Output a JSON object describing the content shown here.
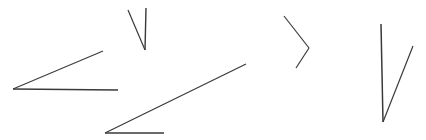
{
  "canvas": {
    "width": 426,
    "height": 140,
    "background_color": "#ffffff",
    "stroke_color": "#3a3a3a",
    "description": "Line drawing of five separate angle figures formed by pairs of straight line segments on a plain white background"
  },
  "chart_data": {
    "type": "diagram",
    "title": "",
    "xlabel": "",
    "ylabel": "",
    "xlim": [
      0,
      426
    ],
    "ylim": [
      140,
      0
    ],
    "grid": false,
    "legend": false,
    "shapes": [
      {
        "name": "acute-angle-left",
        "label": "Acute angle opening to the right",
        "vertex": [
          13,
          89
        ],
        "rays": [
          {
            "name": "upper-ray",
            "from": [
              13,
              89
            ],
            "to": [
              103,
              51
            ],
            "stroke_width": 1.1
          },
          {
            "name": "horizontal-ray",
            "from": [
              13,
              89
            ],
            "to": [
              118,
              90
            ],
            "stroke_width": 1.4
          }
        ]
      },
      {
        "name": "narrow-v-top",
        "label": "Narrow V opening upward",
        "vertex": [
          145,
          50
        ],
        "rays": [
          {
            "name": "left-ray",
            "from": [
              145,
              50
            ],
            "to": [
              128,
              10
            ],
            "stroke_width": 1.2
          },
          {
            "name": "right-ray",
            "from": [
              145,
              50
            ],
            "to": [
              146,
              8
            ],
            "stroke_width": 1.4
          }
        ]
      },
      {
        "name": "wide-angle-bottom",
        "label": "Wide angle opening to the upper right",
        "vertex": [
          105,
          133
        ],
        "rays": [
          {
            "name": "diagonal-ray",
            "from": [
              105,
              133
            ],
            "to": [
              246,
              64
            ],
            "stroke_width": 1.2
          },
          {
            "name": "horizontal-ray",
            "from": [
              105,
              133
            ],
            "to": [
              164,
              133
            ],
            "stroke_width": 1.4
          }
        ]
      },
      {
        "name": "chevron-right",
        "label": "Angle shaped like a greater-than sign opening to the left",
        "vertex": [
          309,
          48
        ],
        "rays": [
          {
            "name": "upper-ray",
            "from": [
              309,
              48
            ],
            "to": [
              284,
              16
            ],
            "stroke_width": 1.2
          },
          {
            "name": "lower-ray",
            "from": [
              309,
              48
            ],
            "to": [
              296,
              68
            ],
            "stroke_width": 1.2
          }
        ]
      },
      {
        "name": "narrow-v-right",
        "label": "Tall narrow V opening upward on the right",
        "vertex": [
          383,
          122
        ],
        "rays": [
          {
            "name": "left-ray",
            "from": [
              383,
              122
            ],
            "to": [
              381,
              24
            ],
            "stroke_width": 1.5
          },
          {
            "name": "right-ray",
            "from": [
              383,
              122
            ],
            "to": [
              413,
              46
            ],
            "stroke_width": 1.2
          }
        ]
      }
    ]
  }
}
